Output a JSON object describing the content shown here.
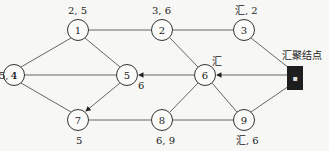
{
  "diagram": {
    "type": "network-graph",
    "nodes": [
      {
        "id": "1",
        "label": "1",
        "annotation": "2, 5"
      },
      {
        "id": "2",
        "label": "2",
        "annotation": "3, 6"
      },
      {
        "id": "3",
        "label": "3",
        "annotation": "汇, 2"
      },
      {
        "id": "4",
        "label": "4",
        "annotation": "5, 1"
      },
      {
        "id": "5",
        "label": "5",
        "annotation": "6"
      },
      {
        "id": "6",
        "label": "6",
        "annotation": "汇"
      },
      {
        "id": "7",
        "label": "7",
        "annotation": "5"
      },
      {
        "id": "8",
        "label": "8",
        "annotation": "6, 9"
      },
      {
        "id": "9",
        "label": "9",
        "annotation": "汇, 6"
      }
    ],
    "sink": {
      "label": "汇聚结点",
      "icon": "sink-node-icon"
    },
    "edges": [
      [
        "1",
        "2"
      ],
      [
        "2",
        "3"
      ],
      [
        "1",
        "4"
      ],
      [
        "1",
        "5"
      ],
      [
        "2",
        "6"
      ],
      [
        "3",
        "sink"
      ],
      [
        "4",
        "5"
      ],
      [
        "4",
        "7"
      ],
      [
        "5",
        "7"
      ],
      [
        "6",
        "5"
      ],
      [
        "sink",
        "6"
      ],
      [
        "6",
        "8"
      ],
      [
        "6",
        "9"
      ],
      [
        "7",
        "8"
      ],
      [
        "8",
        "9"
      ],
      [
        "9",
        "sink"
      ]
    ],
    "directed_edges": [
      [
        "sink",
        "6"
      ],
      [
        "6",
        "5"
      ],
      [
        "5",
        "7"
      ]
    ]
  }
}
